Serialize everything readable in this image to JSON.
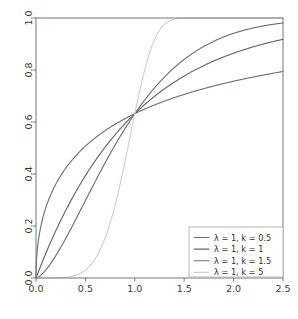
{
  "chart_data": {
    "type": "line",
    "title": "",
    "subtitle": "",
    "xlabel": "",
    "ylabel": "",
    "xlim": [
      0.0,
      2.5
    ],
    "ylim": [
      0.0,
      1.0
    ],
    "grid": false,
    "legend_position": "lower right",
    "x_ticks": [
      "0.0",
      "0.5",
      "1.0",
      "1.5",
      "2.0",
      "2.5"
    ],
    "x_tick_values": [
      0.0,
      0.5,
      1.0,
      1.5,
      2.0,
      2.5
    ],
    "y_ticks": [
      "0.0",
      "0.2",
      "0.4",
      "0.6",
      "0.8",
      "1.0"
    ],
    "y_tick_values": [
      0.0,
      0.2,
      0.4,
      0.6,
      0.8,
      1.0
    ],
    "x": [
      0.0,
      0.05,
      0.1,
      0.15,
      0.2,
      0.25,
      0.3,
      0.35,
      0.4,
      0.45,
      0.5,
      0.55,
      0.6,
      0.65,
      0.7,
      0.75,
      0.8,
      0.85,
      0.9,
      0.95,
      1.0,
      1.05,
      1.1,
      1.15,
      1.2,
      1.25,
      1.3,
      1.35,
      1.4,
      1.45,
      1.5,
      1.6,
      1.7,
      1.8,
      1.9,
      2.0,
      2.1,
      2.2,
      2.3,
      2.4,
      2.5
    ],
    "series": [
      {
        "name": "λ = 1, k = 0.5",
        "lambda": 1,
        "k": 0.5,
        "color": "#6b7280",
        "values": [
          0.0,
          0.2008,
          0.2713,
          0.3212,
          0.3605,
          0.3935,
          0.4218,
          0.4468,
          0.4691,
          0.4894,
          0.5078,
          0.5248,
          0.5406,
          0.5553,
          0.5691,
          0.582,
          0.5942,
          0.6057,
          0.6166,
          0.6269,
          0.6321,
          0.6461,
          0.6551,
          0.6637,
          0.6718,
          0.6796,
          0.6871,
          0.6943,
          0.7011,
          0.7077,
          0.714,
          0.726,
          0.737,
          0.7473,
          0.7568,
          0.7656,
          0.7738,
          0.7815,
          0.7886,
          0.7953,
          0.7945
        ]
      },
      {
        "name": "λ = 1, k = 1",
        "lambda": 1,
        "k": 1,
        "color": "#5f6672",
        "values": [
          0.0,
          0.0488,
          0.0952,
          0.1393,
          0.1813,
          0.2212,
          0.2592,
          0.2953,
          0.3297,
          0.3624,
          0.3935,
          0.4231,
          0.4512,
          0.478,
          0.5034,
          0.5276,
          0.5507,
          0.5726,
          0.5934,
          0.6133,
          0.6321,
          0.6501,
          0.6671,
          0.6834,
          0.6988,
          0.7135,
          0.7275,
          0.7408,
          0.7534,
          0.7654,
          0.7769,
          0.7981,
          0.8173,
          0.8347,
          0.8504,
          0.8647,
          0.8775,
          0.8892,
          0.8997,
          0.9093,
          0.9179
        ]
      },
      {
        "name": "λ = 1, k = 1.5",
        "lambda": 1,
        "k": 1.5,
        "color": "#6a717c",
        "values": [
          0.0,
          0.0111,
          0.0312,
          0.0567,
          0.0861,
          0.1184,
          0.1532,
          0.1899,
          0.2281,
          0.2674,
          0.3077,
          0.3484,
          0.3895,
          0.4306,
          0.4715,
          0.5121,
          0.5521,
          0.5913,
          0.6297,
          0.667,
          0.6321,
          0.7379,
          0.7714,
          0.8031,
          0.833,
          0.8609,
          0.8868,
          0.9106,
          0.9323,
          0.952,
          0.9696,
          0.9884,
          0.9955,
          0.9985,
          0.9995,
          0.9999,
          1.0,
          1.0,
          1.0,
          1.0,
          1.0
        ]
      },
      {
        "name": "λ = 1, k = 5",
        "lambda": 1,
        "k": 5,
        "color": "#cbd0d6",
        "values": [
          0.0,
          0.0,
          0.0001,
          0.0001,
          0.0003,
          0.001,
          0.0024,
          0.0052,
          0.0102,
          0.0182,
          0.0307,
          0.0486,
          0.0737,
          0.1067,
          0.1485,
          0.1993,
          0.2583,
          0.324,
          0.394,
          0.4655,
          0.6321,
          0.6026,
          0.6661,
          0.7234,
          0.7738,
          0.8171,
          0.8534,
          0.8833,
          0.9075,
          0.9267,
          0.9419,
          0.963,
          0.9759,
          0.9849,
          0.9908,
          0.9947,
          0.9971,
          0.9985,
          0.9992,
          0.9996,
          0.9998
        ]
      }
    ]
  },
  "legend": {
    "entries": [
      {
        "label": "λ = 1, k = 0.5",
        "color": "#6b7280"
      },
      {
        "label": "λ = 1, k = 1",
        "color": "#5f6672"
      },
      {
        "label": "λ = 1, k = 1.5",
        "color": "#6a717c"
      },
      {
        "label": "λ = 1, k = 5",
        "color": "#cbd0d6"
      }
    ]
  },
  "axes": {
    "x_tick_labels": [
      "0.0",
      "0.5",
      "1.0",
      "1.5",
      "2.0",
      "2.5"
    ],
    "y_tick_labels": [
      "0.0",
      "0.2",
      "0.4",
      "0.6",
      "0.8",
      "1.0"
    ]
  },
  "colors": {
    "background": "#ffffff",
    "spine": "#777777",
    "tick_text": "#3a3a3a",
    "legend_border": "#b8b8b8"
  }
}
